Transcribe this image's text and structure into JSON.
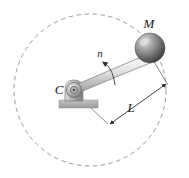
{
  "figure": {
    "width": 189,
    "height": 178,
    "background_color": "#ffffff"
  },
  "labels": {
    "mass": "M",
    "pivot": "C",
    "rotation_speed": "n",
    "length": "L"
  },
  "colors": {
    "line": "#3b3b3b",
    "dashed_path": "#8c8c8c",
    "rod_light": "#f2f2f2",
    "rod_mid": "#c9c9c9",
    "rod_dark": "#8f8f8f",
    "sphere_light": "#d8d8d8",
    "sphere_mid": "#8a8a8a",
    "sphere_dark": "#3f3f3f",
    "bracket_light": "#e2e2e2",
    "bracket_mid": "#b4b4b4",
    "bracket_dark": "#7d7d7d",
    "ground": "#a8a8a8",
    "text": "#1a1a1a"
  },
  "geometry": {
    "pivot_center": {
      "x": 74,
      "y": 90
    },
    "mass_center": {
      "x": 150,
      "y": 48
    },
    "path_circle": {
      "cx": 90,
      "cy": 90,
      "r": 76
    },
    "mass_radius": 15,
    "dimension_label_position": {
      "x": 131,
      "y": 110
    },
    "rotation_arrow_label_position": {
      "x": 102,
      "y": 60
    }
  },
  "annotations": [
    {
      "name": "mass-label",
      "text": "M",
      "meaning": "concentrated mass at end of arm"
    },
    {
      "name": "pivot-label",
      "text": "C",
      "meaning": "center of rotation / pivot point"
    },
    {
      "name": "rotation-label",
      "text": "n",
      "meaning": "rotational speed of the arm"
    },
    {
      "name": "length-label",
      "text": "L",
      "meaning": "length of the arm from pivot to mass"
    }
  ]
}
